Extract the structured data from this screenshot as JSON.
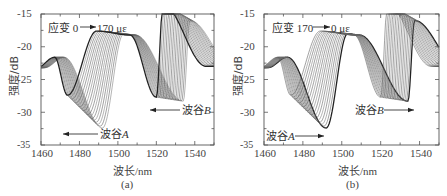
{
  "chart_data": [
    {
      "type": "line",
      "panel_label": "(a)",
      "title": "",
      "xlabel": "波长/nm",
      "ylabel": "强度/dB",
      "xlim": [
        1460,
        1550
      ],
      "ylim": [
        -35,
        -15
      ],
      "xticks": [
        1460,
        1480,
        1500,
        1520,
        1540
      ],
      "yticks": [
        -15,
        -20,
        -25,
        -30,
        -35
      ],
      "grid": false,
      "legend": null,
      "annotations": [
        {
          "text": "应变 0 → 170 με",
          "arrow": "right"
        },
        {
          "text": "波谷A",
          "arrow": "left",
          "note": "dip A shifts toward shorter wavelength"
        },
        {
          "text": "波谷B",
          "arrow": "left",
          "note": "dip B shifts toward shorter wavelength"
        }
      ],
      "series_description": "Family of ~18 transmission spectra for strain 0→170 με; dips move to shorter wavelengths with increasing strain",
      "dip_A": {
        "wavelength_range_nm": [
          1478,
          1492
        ],
        "depth_dB_range": [
          -32.5,
          -27
        ]
      },
      "dip_B": {
        "wavelength_range_nm": [
          1518,
          1534
        ],
        "depth_dB_range": [
          -28.5,
          -27.5
        ]
      },
      "peaks": {
        "near_1500_dB": -17.8,
        "near_1537_dB": -16.2,
        "near_1472_dB": -21.5
      },
      "curve_count": 18
    },
    {
      "type": "line",
      "panel_label": "(b)",
      "title": "",
      "xlabel": "波长/nm",
      "ylabel": "强度/dB",
      "xlim": [
        1460,
        1550
      ],
      "ylim": [
        -35,
        -15
      ],
      "xticks": [
        1460,
        1480,
        1500,
        1520,
        1540
      ],
      "yticks": [
        -15,
        -20,
        -25,
        -30,
        -35
      ],
      "grid": false,
      "legend": null,
      "annotations": [
        {
          "text": "应变 170 → 0 με",
          "arrow": "right"
        },
        {
          "text": "波谷A",
          "arrow": "right",
          "note": "dip A shifts toward longer wavelength"
        },
        {
          "text": "波谷B",
          "arrow": "right",
          "note": "dip B shifts toward longer wavelength"
        }
      ],
      "series_description": "Family of ~18 transmission spectra for strain 170→0 με; dips move to longer wavelengths as strain is released",
      "dip_A": {
        "wavelength_range_nm": [
          1476,
          1491
        ],
        "depth_dB_range": [
          -32.5,
          -27
        ]
      },
      "dip_B": {
        "wavelength_range_nm": [
          1516,
          1533
        ],
        "depth_dB_range": [
          -28.5,
          -27.5
        ]
      },
      "peaks": {
        "near_1500_dB": -18.2,
        "near_1536_dB": -15.8,
        "near_1472_dB": -21.2
      },
      "curve_count": 18
    }
  ],
  "panels": {
    "a": {
      "sublabel": "(a)",
      "xlabel": "波长/nm",
      "ylabel": "强度/dB",
      "strain_prefix": "应变 0",
      "strain_suffix": "170 με",
      "dipA_label": "波谷",
      "dipA_letter": "A",
      "dipB_label": "波谷",
      "dipB_letter": "B",
      "xticks": [
        "1460",
        "1480",
        "1500",
        "1520",
        "1540"
      ],
      "yticks": [
        "-15",
        "-20",
        "-25",
        "-30",
        "-35"
      ]
    },
    "b": {
      "sublabel": "(b)",
      "xlabel": "波长/nm",
      "ylabel": "强度/dB",
      "strain_prefix": "应变 170",
      "strain_suffix": "0 με",
      "dipA_label": "波谷",
      "dipA_letter": "A",
      "dipB_label": "波谷",
      "dipB_letter": "B",
      "xticks": [
        "1460",
        "1480",
        "1500",
        "1520",
        "1540"
      ],
      "yticks": [
        "-15",
        "-20",
        "-25",
        "-30",
        "-35"
      ]
    }
  },
  "colors": {
    "axis": "#555555",
    "curve_dark": "#222222",
    "curve_light": "#888888",
    "text": "#333333"
  }
}
